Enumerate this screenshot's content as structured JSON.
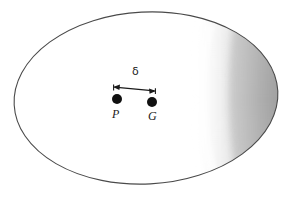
{
  "figure": {
    "name": "ellipse-with-two-points",
    "background_color": "#ffffff",
    "outline_color": "#4a4a4a",
    "fill_color": "#ffffff",
    "shadow_color": "#a5a5a5",
    "marker_color": "#111111",
    "text_color": "#1a1a1a",
    "ellipse": {
      "center_x": 146,
      "center_y": 98,
      "radius_x": 132,
      "radius_y": 86,
      "rotation_deg": -3,
      "stroke_width": 1.1
    },
    "shading": {
      "description": "crescent-shaded-right-limb",
      "terminator_top_x": 206,
      "terminator_mid_x": 196,
      "terminator_bottom_x": 210,
      "light_value": "#ffffff",
      "dark_value": "#9c9c9c"
    },
    "points": [
      {
        "id": "point-p",
        "label": "P",
        "x": 117,
        "y": 99,
        "radius": 5.0
      },
      {
        "id": "point-g",
        "label": "G",
        "x": 152,
        "y": 102,
        "radius": 5.0
      }
    ],
    "measure": {
      "id": "offset-arrow",
      "label": "δ",
      "label_name": "delta",
      "label_x": 137,
      "label_y": 72,
      "arrow_start_x": 114,
      "arrow_start_y": 87,
      "arrow_end_x": 155,
      "arrow_end_y": 91,
      "double_headed": true,
      "stroke_width": 1.2
    }
  }
}
